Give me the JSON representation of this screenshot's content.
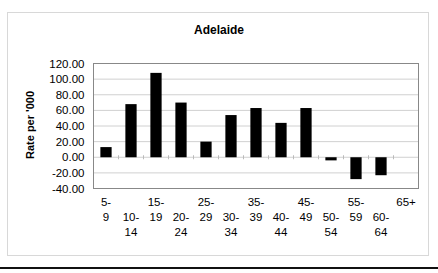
{
  "chart_data": {
    "type": "bar",
    "title": "Adelaide",
    "xlabel": "",
    "ylabel": "Rate per '000",
    "ylim": [
      -40,
      120
    ],
    "yticks": [
      120,
      100,
      80,
      60,
      40,
      20,
      0,
      -20,
      -40
    ],
    "ytick_labels": [
      "120.00",
      "100.00",
      "80.00",
      "60.00",
      "40.00",
      "20.00",
      "0.00",
      "-20.00",
      "-40.00"
    ],
    "grid": true,
    "categories": [
      [
        "5-",
        "9"
      ],
      [
        "10-",
        "14"
      ],
      [
        "15-",
        "19"
      ],
      [
        "20-",
        "24"
      ],
      [
        "25-",
        "29"
      ],
      [
        "30-",
        "34"
      ],
      [
        "35-",
        "39"
      ],
      [
        "40-",
        "44"
      ],
      [
        "45-",
        "49"
      ],
      [
        "50-",
        "54"
      ],
      [
        "55-",
        "59"
      ],
      [
        "60-",
        "64"
      ],
      [
        "65+"
      ]
    ],
    "values": [
      13,
      68,
      108,
      70,
      20,
      54,
      63,
      44,
      63,
      -4,
      -28,
      -23,
      0
    ],
    "bar_color": "#000000",
    "grid_color": "#d0d0d0"
  }
}
